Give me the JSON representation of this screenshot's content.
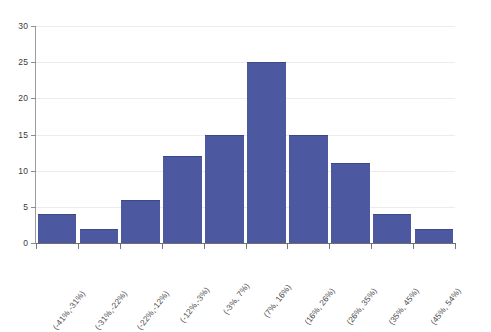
{
  "chart_data": {
    "type": "bar",
    "title": "",
    "xlabel": "",
    "ylabel": "",
    "ylim": [
      0,
      30
    ],
    "y_ticks": [
      0,
      5,
      10,
      15,
      20,
      25,
      30
    ],
    "y_tick_labels": [
      "0",
      "5",
      "10",
      "15",
      "20",
      "25",
      "30"
    ],
    "grid": true,
    "legend": "none",
    "series_color": "#4c59a0",
    "categories": [
      "(-41%,-31%)",
      "(-31%,-22%)",
      "(-22%,-12%)",
      "(-12%,-3%)",
      "(-3%, 7%)",
      "(7%, 16%)",
      "(16%, 26%)",
      "(26%, 35%)",
      "(35%, 45%)",
      "(45%, 54%)"
    ],
    "values": [
      4,
      2,
      6,
      12,
      15,
      25,
      15,
      11,
      4,
      2
    ]
  }
}
